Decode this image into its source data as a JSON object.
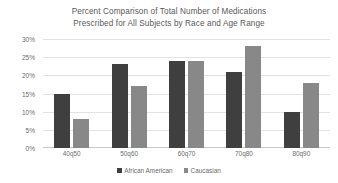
{
  "chart_data": {
    "type": "bar",
    "title": "Percent Comparison of Total Number of Medications Prescribed for All Subjects by Race and Age Range",
    "title_lines": [
      "Percent Comparison of Total Number of Medications",
      "Prescribed for All Subjects by Race and Age Range"
    ],
    "categories": [
      "40q50",
      "50q60",
      "60q70",
      "70q80",
      "80q90"
    ],
    "series": [
      {
        "name": "African American",
        "color": "#3f3f3f",
        "values": [
          15,
          23,
          24,
          21,
          10
        ]
      },
      {
        "name": "Caucasian",
        "color": "#888888",
        "values": [
          8,
          17,
          24,
          28,
          18
        ]
      }
    ],
    "xlabel": "",
    "ylabel": "",
    "ylim": [
      0,
      30
    ],
    "ytick_values": [
      0,
      5,
      10,
      15,
      20,
      25,
      30
    ],
    "ytick_labels": [
      "0%",
      "5%",
      "10%",
      "15%",
      "20%",
      "25%",
      "30%"
    ],
    "grid": true,
    "legend_position": "bottom"
  },
  "colors": {
    "series_african_american": "#3f3f3f",
    "series_caucasian": "#888888",
    "gridline": "#e2e2e2",
    "text": "#6b6b6b",
    "background": "#ffffff"
  }
}
